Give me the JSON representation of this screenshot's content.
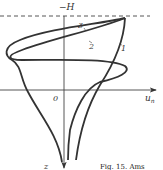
{
  "figure": {
    "axis_labels": {
      "top": "−H",
      "bottom": "z",
      "origin": "0",
      "horizontal": "u",
      "horizontal_sub": "n"
    },
    "curve_labels": [
      "1",
      "2",
      "3"
    ],
    "caption": "Fig. 15. Ams",
    "colors": {
      "ink": "#333333",
      "background": "#ffffff"
    }
  }
}
